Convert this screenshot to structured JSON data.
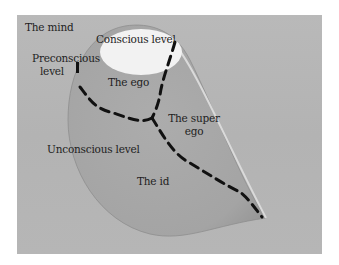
{
  "diagram": {
    "title": "The mind",
    "labels": {
      "conscious": "Conscious level",
      "preconscious_line1": "Preconscious",
      "preconscious_line2": "level",
      "ego": "The ego",
      "superego_line1": "The super",
      "superego_line2": "ego",
      "unconscious": "Unconscious level",
      "id": "The id"
    },
    "colors": {
      "background_panel": "#b6b6b6",
      "teardrop_fill": "#a9a9a9",
      "teardrop_rim": "#d8d8d8",
      "conscious_ellipse": "#f2f2f2",
      "dashed_lines": "#111111",
      "text": "#1e1e1e"
    }
  }
}
